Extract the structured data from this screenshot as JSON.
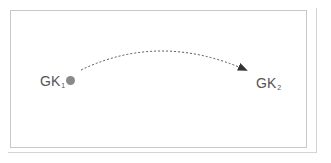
{
  "diagram": {
    "nodes": [
      {
        "id": "gk1",
        "label": "GK",
        "subscript": "1",
        "has_dot": true
      },
      {
        "id": "gk2",
        "label": "GK",
        "subscript": "2",
        "has_dot": false
      }
    ],
    "edges": [
      {
        "from": "gk1",
        "to": "gk2",
        "style": "dashed",
        "arrow": "end"
      }
    ],
    "colors": {
      "text": "#555555",
      "dot": "#8a8a8a",
      "arrow": "#333333",
      "frame": "#c8c8c8"
    }
  }
}
